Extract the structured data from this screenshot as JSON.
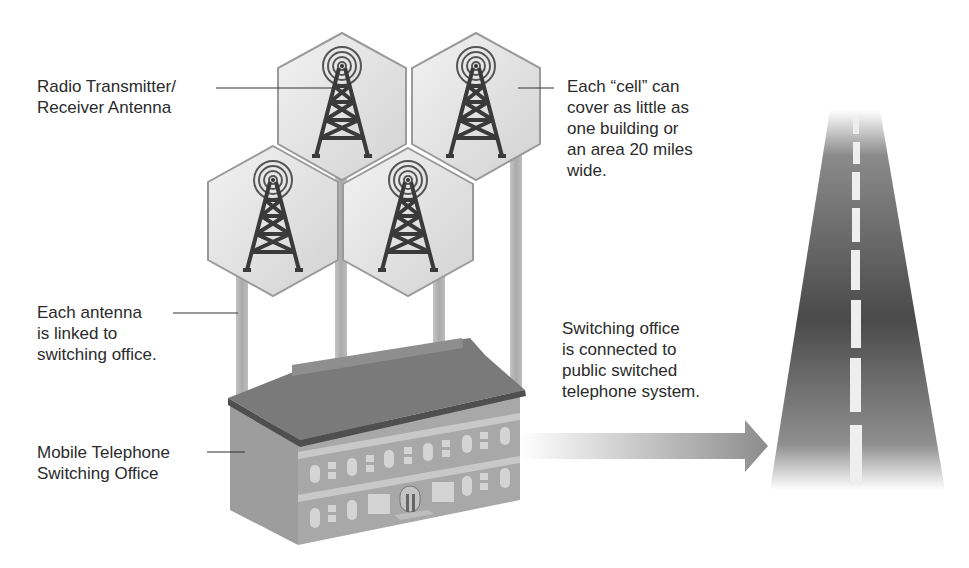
{
  "labels": {
    "antenna": "Radio Transmitter/\nReceiver Antenna",
    "cell": "Each “cell” can\ncover as little as\none building or\nan area 20 miles\nwide.",
    "link": "Each antenna\nis linked to\nswitching office.",
    "office": "Mobile Telephone\nSwitching Office",
    "pstn": "Switching office\nis connected to\npublic switched\ntelephone system."
  },
  "cells": [
    {
      "name": "cell-top-left",
      "cx": 342,
      "cy": 100
    },
    {
      "name": "cell-top-right",
      "cx": 466,
      "cy": 100
    },
    {
      "name": "cell-bottom-left",
      "cx": 272,
      "cy": 220
    },
    {
      "name": "cell-bottom-right",
      "cx": 408,
      "cy": 220
    }
  ],
  "colors": {
    "hex_fill": "#e6e6e6",
    "hex_stroke": "#9a9a9a",
    "tower": "#3a3a3a",
    "pole": "#b5b5b5",
    "roof": "#7a7a7a",
    "wall": "#a9a9a9",
    "road": "#4a4a4a"
  }
}
